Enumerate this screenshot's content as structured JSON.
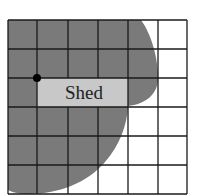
{
  "diagram": {
    "type": "grid-area-figure",
    "grid": {
      "columns": 6,
      "rows": 6,
      "line_color": "#1a1a1a",
      "background": "#ffffff"
    },
    "shaded_region": {
      "color": "#7a7a7a",
      "description": "irregular shaded region covering left portion of grid"
    },
    "shed": {
      "label": "Shed",
      "fill": "#c8c8c8"
    },
    "point_marker": {
      "color": "#000000"
    }
  }
}
